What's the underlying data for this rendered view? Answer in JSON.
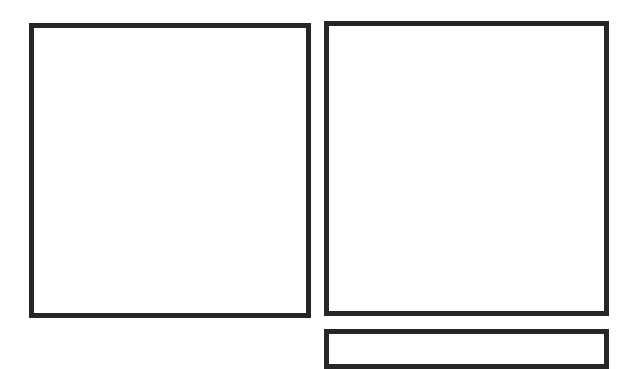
{
  "panels": [
    {
      "id": "panel-1",
      "content": ""
    },
    {
      "id": "panel-2",
      "content": ""
    },
    {
      "id": "panel-3",
      "content": ""
    }
  ],
  "colors": {
    "border": "#262626",
    "background": "#ffffff"
  }
}
